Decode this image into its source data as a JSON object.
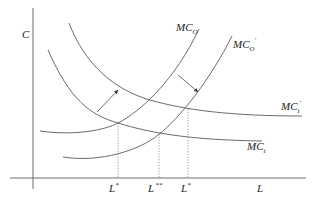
{
  "axes": {
    "y_label": "C",
    "x_label": "L"
  },
  "curves": [
    {
      "id": "MC_O",
      "label_main": "MC",
      "label_sub": "O",
      "label_prime": "",
      "shape": "rising"
    },
    {
      "id": "MC_O_prime",
      "label_main": "MC",
      "label_sub": "O",
      "label_prime": "′",
      "shape": "rising"
    },
    {
      "id": "MC_t_prime",
      "label_main": "MC",
      "label_sub": "t",
      "label_prime": "′",
      "shape": "falling"
    },
    {
      "id": "MC_t",
      "label_main": "MC",
      "label_sub": "t",
      "label_prime": "",
      "shape": "falling"
    }
  ],
  "x_ticks": [
    {
      "label": "L",
      "mark": "*"
    },
    {
      "label": "L",
      "mark": "**"
    },
    {
      "label": "L",
      "mark": "*"
    }
  ],
  "arrows": [
    {
      "from": "MC_t",
      "to": "MC_t_prime",
      "direction": "up-right"
    },
    {
      "from": "MC_O",
      "to": "MC_O_prime",
      "direction": "down-right"
    }
  ],
  "colors": {
    "line": "#5a5a5a",
    "text": "#222222",
    "background": "#ffffff"
  }
}
